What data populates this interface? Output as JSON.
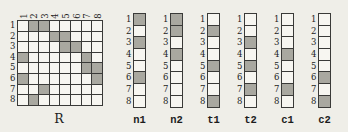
{
  "colors": {
    "background": "#efeee8",
    "cell_fill": "#f7f6f1",
    "shaded_fill": "#a9a8a0",
    "grid_line": "#3a3a38",
    "text": "#1c1c1c"
  },
  "matrix": {
    "label": "R",
    "size": 8,
    "column_labels": [
      "1",
      "2",
      "3",
      "4",
      "5",
      "6",
      "7",
      "8"
    ],
    "row_labels": [
      "1",
      "2",
      "3",
      "4",
      "5",
      "6",
      "7",
      "8"
    ],
    "shaded_cells": [
      [
        1,
        2
      ],
      [
        1,
        3
      ],
      [
        2,
        4
      ],
      [
        2,
        5
      ],
      [
        3,
        5
      ],
      [
        3,
        6
      ],
      [
        4,
        1
      ],
      [
        4,
        7
      ],
      [
        5,
        7
      ],
      [
        5,
        8
      ],
      [
        6,
        1
      ],
      [
        6,
        8
      ],
      [
        7,
        3
      ],
      [
        8,
        2
      ]
    ]
  },
  "vectors": {
    "row_labels": [
      "1",
      "2",
      "3",
      "4",
      "5",
      "6",
      "7",
      "8"
    ],
    "items": [
      {
        "label": "n1",
        "shaded_rows": [
          1,
          3,
          6
        ]
      },
      {
        "label": "n2",
        "shaded_rows": [
          1,
          2,
          4
        ]
      },
      {
        "label": "t1",
        "shaded_rows": [
          2,
          5,
          8
        ]
      },
      {
        "label": "t2",
        "shaded_rows": [
          3,
          5,
          7
        ]
      },
      {
        "label": "c1",
        "shaded_rows": [
          4,
          7
        ]
      },
      {
        "label": "c2",
        "shaded_rows": [
          6,
          8
        ]
      }
    ]
  }
}
